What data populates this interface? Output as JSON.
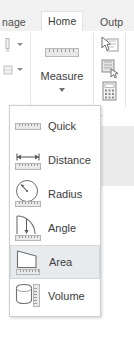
{
  "window": {
    "background_color": "#ffffff"
  },
  "ribbon": {
    "tabs": [
      {
        "label": "nage",
        "name": "tab-manage",
        "active": false
      },
      {
        "label": "Home",
        "name": "tab-home",
        "active": true
      },
      {
        "label": "Outp",
        "name": "tab-output",
        "active": false
      }
    ],
    "active_tab_color": "#ffffff",
    "strip_color": "#f1f1f1",
    "measure": {
      "label": "Measure",
      "icon": "ruler-icon",
      "dropdown_icon": "chevron-down-icon"
    },
    "left_tools": [
      {
        "name": "partial-tool-1",
        "icon": "tool-icon",
        "dropdown_icon": "chevron-down-icon"
      },
      {
        "name": "partial-tool-2",
        "icon": "tool-icon",
        "dropdown_icon": "chevron-down-icon"
      }
    ],
    "right_tools": [
      {
        "name": "select-region-tool",
        "icon": "cursor-rectangle-icon"
      },
      {
        "name": "limit-box-tool",
        "icon": "clip-box-icon"
      },
      {
        "name": "calculator-tool",
        "icon": "calculator-icon"
      }
    ]
  },
  "measure_menu": {
    "selected": "Area",
    "highlight_color": "#e8ebee",
    "items": [
      {
        "label": "Quick",
        "icon": "ruler-quick-icon",
        "selected": false
      },
      {
        "label": "Distance",
        "icon": "distance-arrow-icon",
        "selected": false
      },
      {
        "label": "Radius",
        "icon": "radius-circle-icon",
        "selected": false
      },
      {
        "label": "Angle",
        "icon": "angle-arc-icon",
        "selected": false
      },
      {
        "label": "Area",
        "icon": "area-polygon-icon",
        "selected": true
      },
      {
        "label": "Volume",
        "icon": "volume-cylinder-icon",
        "selected": false
      }
    ]
  }
}
